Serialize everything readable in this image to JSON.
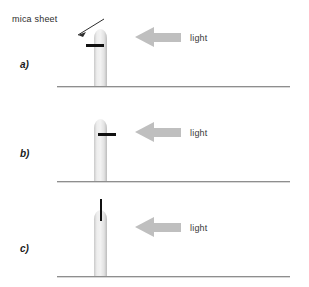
{
  "figure": {
    "background_color": "#ffffff",
    "width": 309,
    "height": 287
  },
  "annotations": {
    "mica_sheet_label": "mica sheet",
    "leader_line": "arrow-leader-line"
  },
  "colors": {
    "coleoptile": "#ededed",
    "coleoptile_edge": "#bcbcbc",
    "mica_sheet": "#111111",
    "light_arrow": "#bfbfbf",
    "ground_line": "#8e8e8e",
    "text": "#2d2d2d"
  },
  "panels": [
    {
      "id": "a",
      "letter": "a)",
      "light_label": "light",
      "light_direction": "left",
      "mica_orientation": "horizontal",
      "mica_position": "left side of tip"
    },
    {
      "id": "b",
      "letter": "b)",
      "light_label": "light",
      "light_direction": "left",
      "mica_orientation": "horizontal",
      "mica_position": "right side of tip"
    },
    {
      "id": "c",
      "letter": "c)",
      "light_label": "light",
      "light_direction": "left",
      "mica_orientation": "vertical",
      "mica_position": "centered in tip"
    }
  ]
}
